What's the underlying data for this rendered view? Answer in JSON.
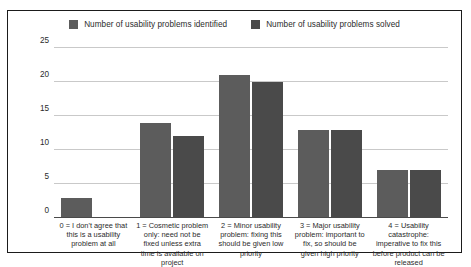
{
  "chart_data": {
    "type": "bar",
    "title": "",
    "xlabel": "",
    "ylabel": "",
    "ylim": [
      0,
      25
    ],
    "yticks": [
      "0",
      "5",
      "10",
      "15",
      "20",
      "25"
    ],
    "grid": true,
    "legend_position": "top-center",
    "categories": [
      "0 = I don't agree that this is a usability problem at all",
      "1 = Cosmetic problem only: need not be fixed unless extra time is available on project",
      "2 = Minor usability problem: fixing this should be given low priority",
      "3 = Major usability problem: important to fix, so should be given high priority",
      "4 = Usability catastrophe: imperative to fix this before product can be released"
    ],
    "series": [
      {
        "name": "Number of usability problems identified",
        "color": "#5c5c5c",
        "values": [
          3,
          14,
          21,
          13,
          7
        ]
      },
      {
        "name": "Number of usability problems solved",
        "color": "#4a4a4a",
        "values": [
          0,
          12,
          20,
          13,
          7
        ]
      }
    ]
  },
  "colors": {
    "frame_border": "#1b1b1b",
    "gridline": "#c9c9c9",
    "axis": "#4a4a4a",
    "background": "#ffffff",
    "text": "#2b2b2b"
  }
}
